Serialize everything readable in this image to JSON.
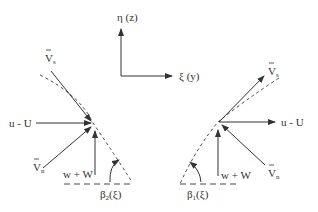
{
  "axes": {
    "vertical_label": "η (z)",
    "horizontal_label": "ξ (y)"
  },
  "left_figure": {
    "vs_label": "V",
    "vs_sub": "s",
    "flow_label": "u - U",
    "vn_label": "V",
    "vn_sub": "n",
    "vertical_label": "w + W",
    "angle_label_base": "β",
    "angle_label_sub": "2",
    "angle_label_arg": "(ξ)"
  },
  "right_figure": {
    "vs_label": "V",
    "vs_sub": "s",
    "flow_label": "u - U",
    "vn_label": "V",
    "vn_sub": "n",
    "vertical_label": "w + W",
    "angle_label_base": "β",
    "angle_label_sub": "1",
    "angle_label_arg": "(ξ)"
  },
  "colors": {
    "stroke": "#333333",
    "background": "#ffffff"
  }
}
